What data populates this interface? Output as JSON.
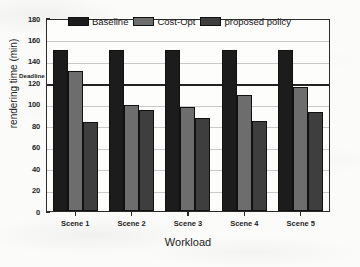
{
  "chart_data": {
    "type": "bar",
    "title": "",
    "xlabel": "Workload",
    "ylabel": "rendering time (min)",
    "categories": [
      "Scene 1",
      "Scene 2",
      "Scene 3",
      "Scene 4",
      "Scene 5"
    ],
    "series": [
      {
        "name": "Baseline",
        "color": "#1c1c1c",
        "values": [
          150,
          150,
          150,
          150,
          150
        ]
      },
      {
        "name": "Cost-Opt",
        "color": "#6d6d6d",
        "values": [
          131,
          99,
          97,
          108,
          116
        ]
      },
      {
        "name": "proposed policy",
        "color": "#3e3e3e",
        "values": [
          83,
          94,
          87,
          84,
          92
        ]
      }
    ],
    "ylim": [
      0,
      180
    ],
    "yticks": [
      0,
      20,
      40,
      60,
      80,
      100,
      120,
      140,
      160,
      180
    ],
    "ytick_labels": [
      "0",
      "20",
      "40",
      "60",
      "80",
      "100",
      "120",
      "140",
      "160",
      "180"
    ],
    "grid": "horizontal",
    "legend_position": "top-center",
    "annotations": [
      {
        "name": "deadline",
        "label": "Deadline",
        "y": 120,
        "style": "solid-horizontal-line"
      }
    ]
  },
  "legend": {
    "entries": [
      {
        "label": "Baseline"
      },
      {
        "label": "Cost-Opt"
      },
      {
        "label": "proposed policy"
      }
    ]
  },
  "axes": {
    "y_title": "rendering time (min)",
    "x_title": "Workload",
    "deadline_label": "Deadline"
  }
}
